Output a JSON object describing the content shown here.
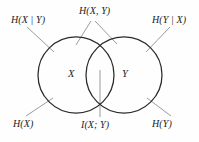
{
  "figure": {
    "type": "venn-diagram",
    "stroke_color": "#2a2a2a",
    "leader_color": "#8a8a8a",
    "text_color": "#1c1c1c",
    "background_color": "#fefefe"
  },
  "circles": {
    "left": {
      "label": "X",
      "cx": 76,
      "cy": 75,
      "r": 38
    },
    "right": {
      "label": "Y",
      "cx": 124,
      "cy": 75,
      "r": 38
    }
  },
  "labels": {
    "conditional_x_given_y": "H(X | Y)",
    "joint_entropy": "H(X, Y)",
    "conditional_y_given_x": "H(Y | X)",
    "entropy_x": "H(X)",
    "mutual_information": "I(X; Y)",
    "entropy_y": "H(Y)",
    "set_x": "X",
    "set_y": "Y"
  }
}
